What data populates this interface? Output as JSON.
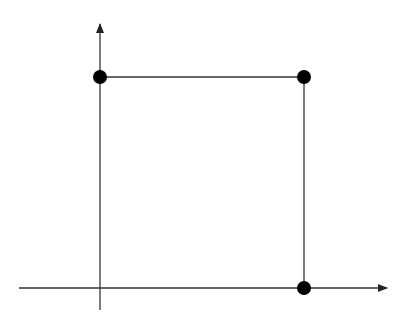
{
  "diagram": {
    "type": "coordinate-plot",
    "background": "#ffffff",
    "stroke_color": "#333333",
    "point_color": "#000000",
    "axes": {
      "x_axis": {
        "x1": 19,
        "y1": 288,
        "x2": 387,
        "y2": 288,
        "arrow": "right"
      },
      "y_axis": {
        "x1": 100,
        "y1": 310,
        "x2": 100,
        "y2": 24,
        "arrow": "up"
      }
    },
    "segments": [
      {
        "name": "top-edge",
        "x1": 100,
        "y1": 77,
        "x2": 304,
        "y2": 77
      },
      {
        "name": "right-edge",
        "x1": 304,
        "y1": 77,
        "x2": 304,
        "y2": 288
      }
    ],
    "points": [
      {
        "name": "point-top-left",
        "cx": 100,
        "cy": 77,
        "r": 7
      },
      {
        "name": "point-top-right",
        "cx": 304,
        "cy": 77,
        "r": 7
      },
      {
        "name": "point-bottom-right",
        "cx": 304,
        "cy": 288,
        "r": 7
      }
    ]
  }
}
